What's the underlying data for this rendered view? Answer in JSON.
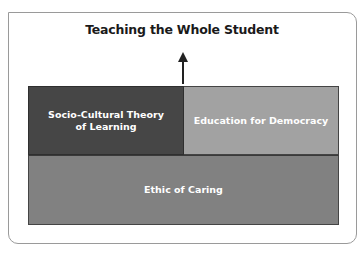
{
  "diagram": {
    "title": "Teaching the Whole Student",
    "boxes": [
      {
        "label_line1": "Socio-Cultural Theory",
        "label_line2": "of Learning",
        "color": "#464646"
      },
      {
        "label": "Education for Democracy",
        "color": "#a2a2a2"
      },
      {
        "label": "Ethic of Caring",
        "color": "#818181"
      }
    ],
    "arrow": "up-arrow"
  }
}
